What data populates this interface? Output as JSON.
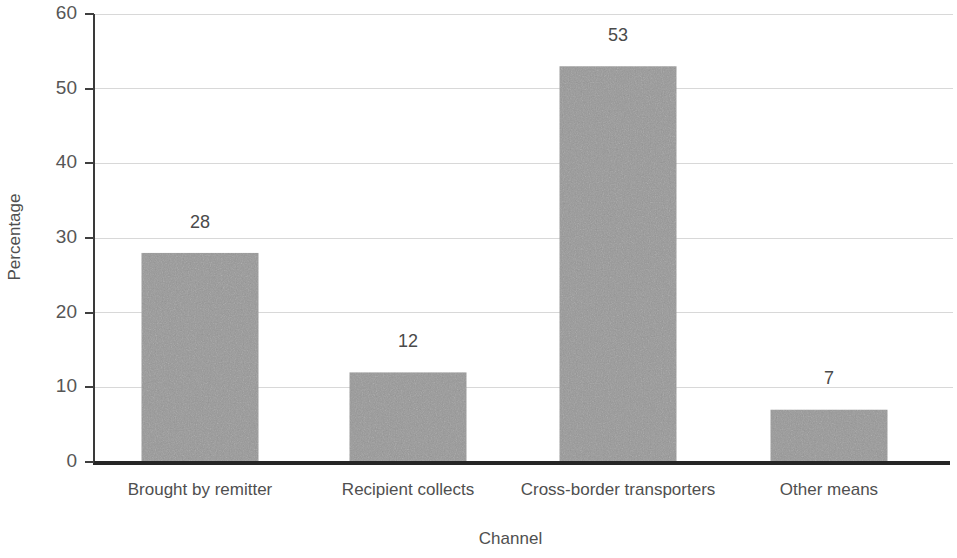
{
  "chart_data": {
    "type": "bar",
    "title": "",
    "subtitle": "",
    "xlabel": "Channel",
    "ylabel": "Percentage",
    "categories": [
      "Brought by remitter",
      "Recipient collects",
      "Cross-border transporters",
      "Other means"
    ],
    "values": [
      28,
      12,
      53,
      7
    ],
    "data_labels": [
      "28",
      "12",
      "53",
      "7"
    ],
    "ylim": [
      0,
      60
    ],
    "ytick_labels": [
      "0",
      "10",
      "20",
      "30",
      "40",
      "50",
      "60"
    ],
    "ytick_values": [
      0,
      10,
      20,
      30,
      40,
      50,
      60
    ],
    "grid": "horizontal",
    "legend": "none",
    "bar_color": "#989898",
    "gridline_color": "#d8d8d8",
    "axis_color": "#262626",
    "text_color": "#4f4f4f",
    "background_color": "#ffffff",
    "units": "percent"
  },
  "layout": {
    "plot_left": 94,
    "plot_right": 953,
    "plot_top": 14,
    "plot_bottom": 462,
    "bar_width": 117,
    "bar_centers": [
      200,
      408,
      618,
      829
    ],
    "cat_label_y": 491,
    "xlabel_y": 540,
    "ylabel_x": 16,
    "ylabel_y": 237
  }
}
